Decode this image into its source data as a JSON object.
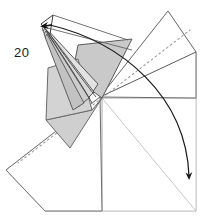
{
  "figure": {
    "type": "origami-fold-diagram",
    "step_number": "20",
    "step_number_position": {
      "x": 14,
      "y": 57
    },
    "canvas": {
      "width": 218,
      "height": 219
    },
    "background_color": "#ffffff"
  },
  "colors": {
    "outline_dark": "#4a4a4a",
    "outline_light": "#b9b9b9",
    "outline_mid": "#8a8a8a",
    "shade_gray": "#c9c9c9",
    "shade_gray_light": "#dedede",
    "shade_gray_dark": "#b0b0b0",
    "dash_line": "#8f8f8f",
    "arrow_stroke": "#1a1a1a",
    "paper_white": "#ffffff",
    "text": "#1a1a1a"
  },
  "shapes": {
    "base_sheet_light": {
      "label": "large background paper sheet",
      "points": "6,170 45,211 196,211 196,52 168,11 100,97"
    },
    "lower_right_square": {
      "label": "lower right square panel",
      "points": "102,98 196,98 196,211 102,211"
    },
    "right_upper_flap": {
      "label": "upper right folded flap",
      "points": "100,97 168,11 196,52 196,98"
    },
    "right_mid_flap": {
      "label": "right middle triangular flap",
      "points": "100,97 196,52 196,98"
    },
    "left_lower_flap": {
      "label": "lower left long flap",
      "points": "100,97 6,170 45,211 102,211"
    },
    "shaded_right_triangle": {
      "label": "upper shaded triangular face",
      "points": "78,45 132,39 102,98 72,76"
    },
    "shaded_left_quad": {
      "label": "left shaded quadrilateral face",
      "points": "48,68 78,59 92,110 46,120"
    },
    "shaded_lower_wedge": {
      "label": "lower shaded wedge face",
      "points": "46,120 92,110 102,98 70,148"
    },
    "beak_small_triangle": {
      "label": "small pointed triangle at top",
      "points": "41,24 52,15 50,33"
    },
    "neck_strips": {
      "label": "narrow curved neck strips running from beak to body",
      "point_sets": [
        "44,26 96,86 88,97 42,29",
        "45,28 93,92 84,100 43,31",
        "46,31 90,97 80,103 44,34",
        "47,34 86,101 76,106 45,37"
      ]
    }
  },
  "dashed_fold_lines": [
    {
      "name": "fold-line-upper-right",
      "from": {
        "x": 102,
        "y": 98
      },
      "to": {
        "x": 190,
        "y": 30
      }
    },
    {
      "name": "fold-line-lower-left",
      "from": {
        "x": 102,
        "y": 98
      },
      "to": {
        "x": 18,
        "y": 163
      }
    }
  ],
  "solid_crease_lines": [
    {
      "name": "crease-center-vertical",
      "from": {
        "x": 102,
        "y": 98
      },
      "to": {
        "x": 102,
        "y": 211
      }
    },
    {
      "name": "crease-center-horizontal",
      "from": {
        "x": 102,
        "y": 98
      },
      "to": {
        "x": 196,
        "y": 98
      }
    },
    {
      "name": "crease-diagonal-to-corner",
      "from": {
        "x": 102,
        "y": 98
      },
      "to": {
        "x": 196,
        "y": 211
      }
    },
    {
      "name": "crease-left-edge-upper",
      "from": {
        "x": 100,
        "y": 97
      },
      "to": {
        "x": 6,
        "y": 170
      }
    },
    {
      "name": "crease-left-edge-lower",
      "from": {
        "x": 45,
        "y": 211
      },
      "to": {
        "x": 102,
        "y": 98
      }
    },
    {
      "name": "crease-right-flap-edge",
      "from": {
        "x": 100,
        "y": 97
      },
      "to": {
        "x": 196,
        "y": 52
      }
    },
    {
      "name": "crease-top-apex-left",
      "from": {
        "x": 168,
        "y": 11
      },
      "to": {
        "x": 100,
        "y": 97
      }
    },
    {
      "name": "crease-top-apex-right",
      "from": {
        "x": 168,
        "y": 11
      },
      "to": {
        "x": 196,
        "y": 52
      }
    }
  ],
  "arrows": [
    {
      "name": "fold-arrow-main",
      "description": "long curved arrow sweeping from upper left beak area down to lower right corner",
      "path": "M 50,25 C 120,40 185,95 190,178",
      "head": {
        "x": 190,
        "y": 183,
        "angle": 68
      }
    },
    {
      "name": "fold-arrow-beak",
      "description": "small solid arrowhead inside the small triangle at the beak tip",
      "head": {
        "x": 44,
        "y": 26,
        "angle": 200
      }
    }
  ],
  "labels": {
    "step_number": "20"
  },
  "annotations": {
    "beak_guide_line_upper": {
      "from": {
        "x": 52,
        "y": 15
      },
      "to": {
        "x": 128,
        "y": 40
      }
    },
    "beak_guide_line_lower": {
      "from": {
        "x": 44,
        "y": 27
      },
      "to": {
        "x": 132,
        "y": 50
      }
    }
  }
}
